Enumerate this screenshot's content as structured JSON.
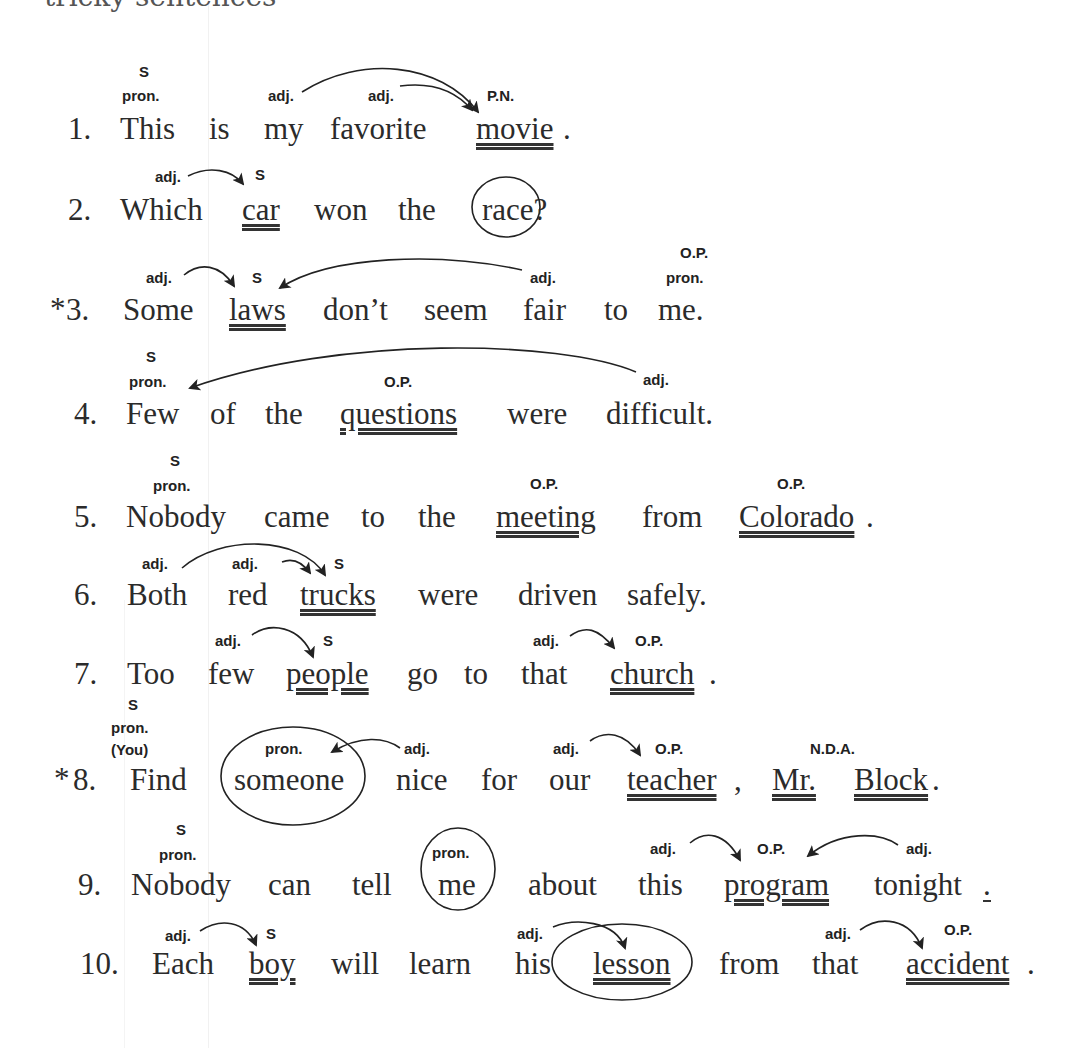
{
  "header": {
    "partial_title": "tricky sentences"
  },
  "sentences": [
    {
      "number": "1.",
      "star": "",
      "words": [
        "This",
        "is",
        "my",
        "favorite",
        "movie",
        "."
      ],
      "labels": {
        "this_top": "S",
        "this_bottom": "pron.",
        "my": "adj.",
        "favorite": "adj.",
        "movie": "P.N."
      }
    },
    {
      "number": "2.",
      "star": "",
      "words": [
        "Which",
        "car",
        "won",
        "the",
        "race?"
      ],
      "labels": {
        "which": "adj.",
        "car": "S"
      }
    },
    {
      "number": "3.",
      "star": "*",
      "words": [
        "Some",
        "laws",
        "don’t",
        "seem",
        "fair",
        "to",
        "me."
      ],
      "labels": {
        "some": "adj.",
        "laws": "S",
        "fair": "adj.",
        "me_top": "O.P.",
        "me_bottom": "pron."
      }
    },
    {
      "number": "4.",
      "star": "",
      "words": [
        "Few",
        "of",
        "the",
        "questions",
        "were",
        "difficult."
      ],
      "labels": {
        "few_top": "S",
        "few_bottom": "pron.",
        "questions": "O.P.",
        "difficult": "adj."
      }
    },
    {
      "number": "5.",
      "star": "",
      "words": [
        "Nobody",
        "came",
        "to",
        "the",
        "meeting",
        "from",
        "Colorado",
        "."
      ],
      "labels": {
        "nobody_top": "S",
        "nobody_bottom": "pron.",
        "meeting": "O.P.",
        "colorado": "O.P."
      }
    },
    {
      "number": "6.",
      "star": "",
      "words": [
        "Both",
        "red",
        "trucks",
        "were",
        "driven",
        "safely."
      ],
      "labels": {
        "both": "adj.",
        "red": "adj.",
        "trucks": "S"
      }
    },
    {
      "number": "7.",
      "star": "",
      "words": [
        "Too",
        "few",
        "people",
        "go",
        "to",
        "that",
        "church",
        "."
      ],
      "labels": {
        "few": "adj.",
        "people": "S",
        "that": "adj.",
        "church": "O.P."
      }
    },
    {
      "number": "8.",
      "star": "*",
      "words": [
        "Find",
        "someone",
        "nice",
        "for",
        "our",
        "teacher",
        ",",
        "Mr.",
        "Block",
        "."
      ],
      "labels": {
        "you_1": "S",
        "you_2": "pron.",
        "you_3": "(You)",
        "someone": "pron.",
        "nice": "adj.",
        "our": "adj.",
        "teacher": "O.P.",
        "block": "N.D.A."
      }
    },
    {
      "number": "9.",
      "star": "",
      "words": [
        "Nobody",
        "can",
        "tell",
        "me",
        "about",
        "this",
        "program",
        "tonight",
        "."
      ],
      "labels": {
        "nobody_top": "S",
        "nobody_bottom": "pron.",
        "me": "pron.",
        "this": "adj.",
        "program": "O.P.",
        "tonight": "adj."
      }
    },
    {
      "number": "10.",
      "star": "",
      "words": [
        "Each",
        "boy",
        "will",
        "learn",
        "his",
        "lesson",
        "from",
        "that",
        "accident",
        "."
      ],
      "labels": {
        "each": "adj.",
        "boy": "S",
        "his": "adj.",
        "that": "adj.",
        "accident": "O.P."
      }
    }
  ],
  "colors": {
    "ink": "#2b2b2b",
    "label_ink": "#222222",
    "paper": "#ffffff"
  }
}
